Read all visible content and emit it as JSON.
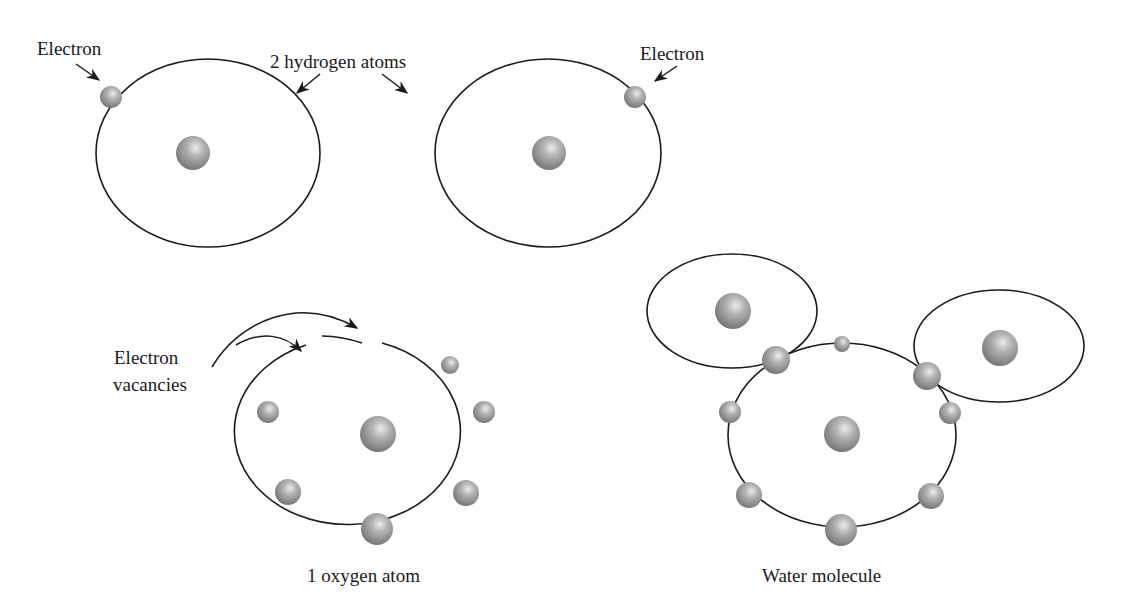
{
  "labels": {
    "electron_left": "Electron",
    "hydrogen_atoms": "2 hydrogen atoms",
    "electron_right": "Electron",
    "vacancies_line1": "Electron",
    "vacancies_line2": "vacancies",
    "oxygen_atom": "1 oxygen atom",
    "water_molecule": "Water molecule"
  },
  "atoms": {
    "hydrogen_count": 2,
    "hydrogen_electrons_each": 1,
    "oxygen_count": 1,
    "oxygen_outer_electrons": 6,
    "oxygen_vacancies": 2,
    "water_outer_electrons": 8
  },
  "colors": {
    "line": "#1a1a1a",
    "particle_light": "#e8e8e8",
    "particle_dark": "#6e6e6e"
  }
}
